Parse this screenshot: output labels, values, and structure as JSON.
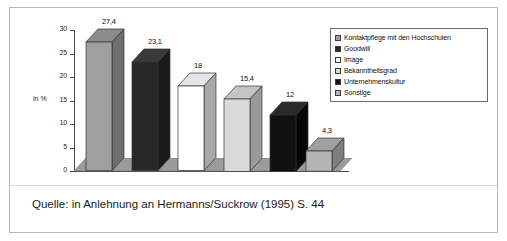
{
  "chart_data": {
    "type": "bar",
    "title": "",
    "subtitle": "",
    "xlabel": "",
    "ylabel": "in %",
    "ylim": [
      0,
      30
    ],
    "ytick_labels": [
      "30",
      "25",
      "20",
      "15",
      "10",
      "5",
      "0"
    ],
    "ytick_values": [
      30,
      25,
      20,
      15,
      10,
      5,
      0
    ],
    "grid": false,
    "legend_position": "top-right",
    "categories": [
      "Kontaktpflege mit den Hochschulen",
      "Goodwill",
      "Image",
      "Bekanntheitsgrad",
      "Unternehmenskultur",
      "Sonstige"
    ],
    "values": [
      27.4,
      23.1,
      18,
      15.4,
      12,
      4.3
    ],
    "value_labels": [
      "27,4",
      "23,1",
      "18",
      "15,4",
      "12",
      "4,3"
    ],
    "bar_colors": [
      "#a0a0a0",
      "#282828",
      "#ffffff",
      "#d9d9d9",
      "#111111",
      "#b5b5b5"
    ],
    "bar_side_colors": [
      "#6e6e6e",
      "#1a1a1a",
      "#a8a8a8",
      "#9a9a9a",
      "#050505",
      "#7d7d7d"
    ],
    "bar_top_colors": [
      "#8c8c8c",
      "#3a3a3a",
      "#e6e6e6",
      "#c4c4c4",
      "#2a2a2a",
      "#a0a0a0"
    ],
    "floor_color": "#b0b0b0",
    "floor_top_color": "#9b9b9b",
    "axis_color": "#4a4a4a"
  },
  "legend": {
    "items": [
      {
        "label": "Kontaktpflege mit den Hochschulen",
        "color": "#a0a0a0"
      },
      {
        "label": "Goodwill",
        "color": "#282828"
      },
      {
        "label": "Image",
        "color": "#ffffff"
      },
      {
        "label": "Bekanntheitsgrad",
        "color": "#d9d9d9"
      },
      {
        "label": "Unternehmenskultur",
        "color": "#111111"
      },
      {
        "label": "Sonstige",
        "color": "#b5b5b5"
      }
    ]
  },
  "axis": {
    "y_title": "in %"
  },
  "caption": {
    "text": "Quelle: in Anlehnung an Hermanns/Suckrow (1995) S. 44"
  }
}
